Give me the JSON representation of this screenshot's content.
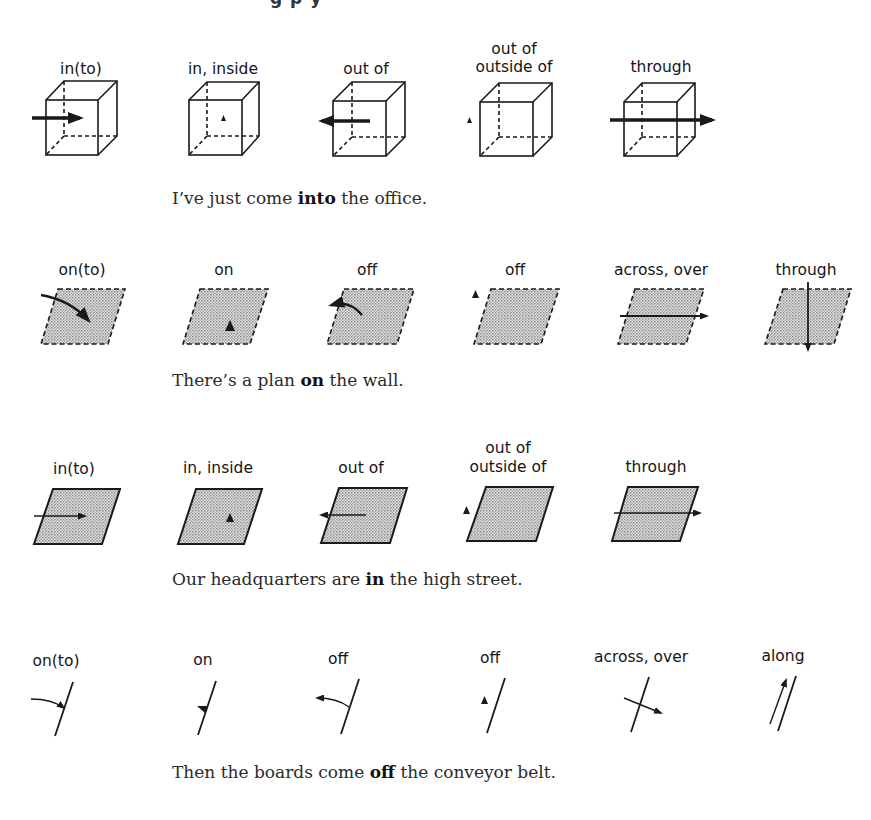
{
  "header": {
    "partial_title_fragment": "g p y"
  },
  "sections": [
    {
      "id": "volume",
      "labels": [
        "in(to)",
        "in, inside",
        "out of",
        "out of\noutside of",
        "through"
      ],
      "label_lines": [
        [
          "in(to)"
        ],
        [
          "in, inside"
        ],
        [
          "out of"
        ],
        [
          "out of",
          "outside of"
        ],
        [
          "through"
        ]
      ],
      "sentence": {
        "before": "I’ve just come ",
        "bold": "into",
        "after": " the office."
      }
    },
    {
      "id": "surface-dashed",
      "labels": [
        "on(to)",
        "on",
        "off",
        "off",
        "across, over",
        "through"
      ],
      "label_lines": [
        [
          "on(to)"
        ],
        [
          "on"
        ],
        [
          "off"
        ],
        [
          "off"
        ],
        [
          "across, over"
        ],
        [
          "through"
        ]
      ],
      "sentence": {
        "before": "There’s a plan ",
        "bold": "on",
        "after": " the wall."
      }
    },
    {
      "id": "area",
      "labels": [
        "in(to)",
        "in, inside",
        "out of",
        "out of\noutside of",
        "through"
      ],
      "label_lines": [
        [
          "in(to)"
        ],
        [
          "in, inside"
        ],
        [
          "out of"
        ],
        [
          "out of",
          "outside of"
        ],
        [
          "through"
        ]
      ],
      "sentence": {
        "before": "Our headquarters are ",
        "bold": "in",
        "after": " the high street."
      }
    },
    {
      "id": "line",
      "labels": [
        "on(to)",
        "on",
        "off",
        "off",
        "across, over",
        "along"
      ],
      "label_lines": [
        [
          "on(to)"
        ],
        [
          "on"
        ],
        [
          "off"
        ],
        [
          "off"
        ],
        [
          "across, over"
        ],
        [
          "along"
        ]
      ],
      "sentence": {
        "before": "Then the boards come ",
        "bold": "off",
        "after": " the conveyor belt."
      }
    }
  ],
  "colors": {
    "ink": "#1a1a1a",
    "stipple": "#c9c9c9",
    "background": "#ffffff"
  }
}
